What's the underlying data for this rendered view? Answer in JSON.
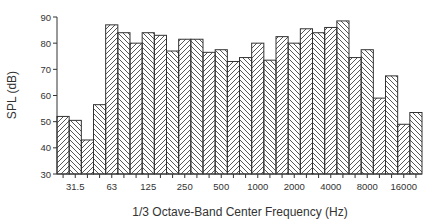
{
  "chart_data": {
    "type": "bar",
    "title": "",
    "xlabel": "1/3 Octave-Band Center Frequency (Hz)",
    "ylabel": "SPL (dB)",
    "ylim": [
      30,
      90
    ],
    "yticks": [
      30,
      40,
      50,
      60,
      70,
      80,
      90
    ],
    "grid": false,
    "legend": null,
    "categories": [
      "25",
      "31.5",
      "40",
      "50",
      "63",
      "80",
      "100",
      "125",
      "160",
      "200",
      "250",
      "315",
      "400",
      "500",
      "630",
      "800",
      "1000",
      "1250",
      "1600",
      "2000",
      "2500",
      "3150",
      "4000",
      "5000",
      "6300",
      "8000",
      "10000",
      "12500",
      "16000",
      "20000"
    ],
    "xtick_labels": [
      "31.5",
      "63",
      "125",
      "250",
      "500",
      "1000",
      "2000",
      "4000",
      "8000",
      "16000"
    ],
    "xtick_label_bar_indices": [
      1,
      4,
      7,
      10,
      13,
      16,
      19,
      22,
      25,
      28
    ],
    "values": [
      52,
      50.5,
      43,
      56.5,
      87,
      84,
      80,
      84,
      83,
      77,
      81.5,
      81.5,
      76.5,
      77.5,
      73,
      74.5,
      80,
      73.5,
      82.5,
      80,
      85.5,
      84,
      86,
      88.5,
      74.5,
      77.5,
      59,
      67.5,
      49,
      53.5
    ],
    "bar_fill": "hatched"
  }
}
